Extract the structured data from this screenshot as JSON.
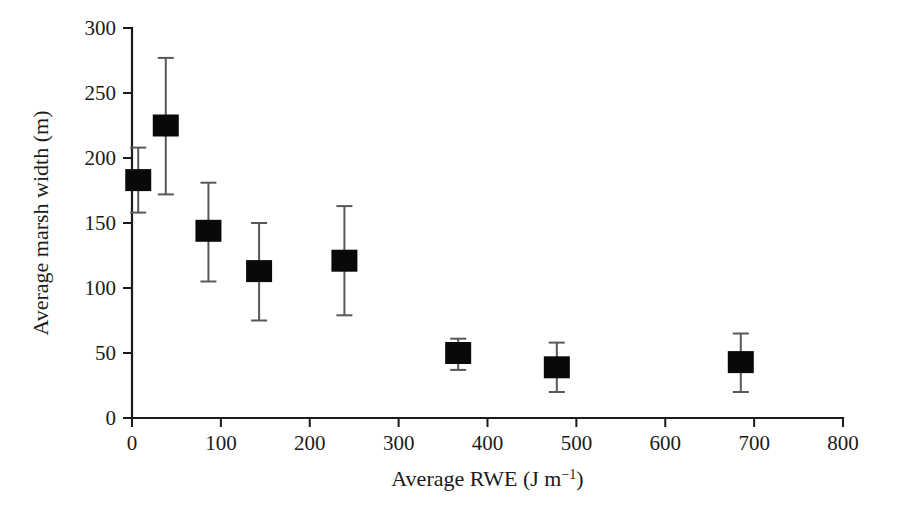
{
  "figure": {
    "background_color": "#ffffff",
    "marker_color": "#090909",
    "errorbar_color": "#585858",
    "axis_color": "#1a1a1a"
  },
  "chart_data": {
    "type": "scatter",
    "title": "",
    "xlabel": "Average RWE (J m−1)",
    "xlabel_parts": {
      "main": "Average RWE (J m",
      "exponent": "−1",
      "tail": ")"
    },
    "ylabel": "Average marsh width (m)",
    "xlim": [
      0,
      800
    ],
    "ylim": [
      0,
      300
    ],
    "xticks": [
      0,
      100,
      200,
      300,
      400,
      500,
      600,
      700,
      800
    ],
    "yticks": [
      0,
      50,
      100,
      150,
      200,
      250,
      300
    ],
    "xtick_labels": [
      "0",
      "100",
      "200",
      "300",
      "400",
      "500",
      "600",
      "700",
      "800"
    ],
    "ytick_labels": [
      "0",
      "50",
      "100",
      "150",
      "200",
      "250",
      "300"
    ],
    "grid": false,
    "legend": false,
    "marker": "square",
    "error_bars": "y",
    "points": [
      {
        "x": 7,
        "y": 183,
        "yerr_low": 158,
        "yerr_high": 208
      },
      {
        "x": 38,
        "y": 225,
        "yerr_low": 172,
        "yerr_high": 277
      },
      {
        "x": 86,
        "y": 144,
        "yerr_low": 105,
        "yerr_high": 181
      },
      {
        "x": 143,
        "y": 113,
        "yerr_low": 75,
        "yerr_high": 150
      },
      {
        "x": 239,
        "y": 121,
        "yerr_low": 79,
        "yerr_high": 163
      },
      {
        "x": 367,
        "y": 50,
        "yerr_low": 37,
        "yerr_high": 61
      },
      {
        "x": 478,
        "y": 39,
        "yerr_low": 20,
        "yerr_high": 58
      },
      {
        "x": 685,
        "y": 43,
        "yerr_low": 20,
        "yerr_high": 65
      }
    ]
  }
}
